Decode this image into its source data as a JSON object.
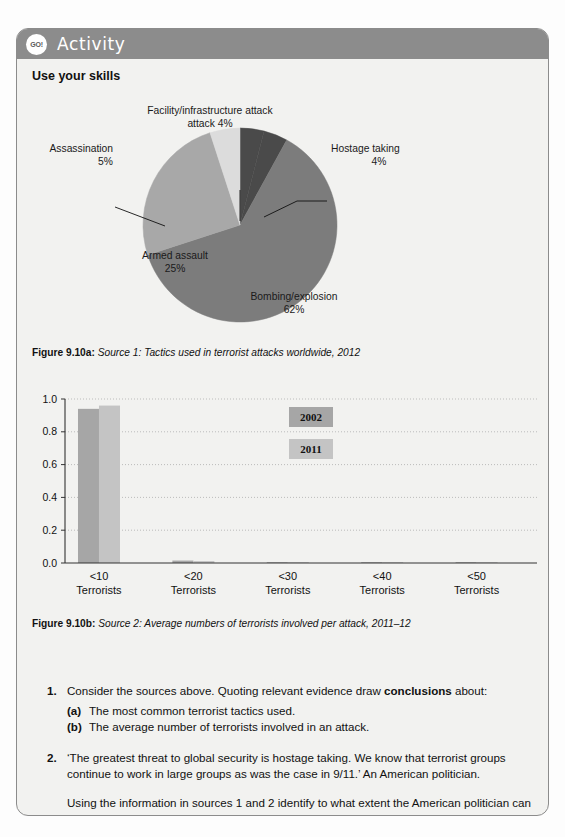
{
  "header": {
    "badge_label": "GO!",
    "title": "Activity",
    "header_color": "#8c8c8c"
  },
  "section_heading": "Use your skills",
  "figures": [
    {
      "id": "fig-9-10a",
      "label": "Figure 9.10a:",
      "caption": "Source 1: Tactics used in terrorist attacks worldwide, 2012"
    },
    {
      "id": "fig-9-10b",
      "label": "Figure 9.10b:",
      "caption": "Source 2: Average numbers of terrorists involved per attack, 2011–12"
    }
  ],
  "chart_data": [
    {
      "type": "pie",
      "title": "Tactics used in terrorist attacks worldwide, 2012",
      "labels": [
        "Bombing/explosion",
        "Armed assault",
        "Assassination",
        "Facility/infrastructure attack",
        "Hostage taking"
      ],
      "values": [
        62,
        25,
        5,
        4,
        4
      ],
      "value_labels": [
        "62%",
        "25%",
        "5%",
        "4%",
        "4%"
      ],
      "label_lines": [
        "Bombing/explosion\n62%",
        "Armed assault\n25%",
        "Assassination\n5%",
        "Facility/infrastructure\nattack 4%",
        "Hostage taking\n4%"
      ],
      "colors": [
        "#7c7c7c",
        "#a8a8a8",
        "#dcdcdc",
        "#4a4a4a",
        "#4a4a4a"
      ],
      "legend": "none",
      "units": "percent"
    },
    {
      "type": "bar",
      "title": "Average numbers of terrorists involved per attack, 2011–12",
      "categories": [
        "<10\nTerrorists",
        "<20\nTerrorists",
        "<30\nTerrorists",
        "<40\nTerrorists",
        "<50\nTerrorists"
      ],
      "category_top": [
        "<10",
        "<20",
        "<30",
        "<40",
        "<50"
      ],
      "category_bottom": [
        "Terrorists",
        "Terrorists",
        "Terrorists",
        "Terrorists",
        "Terrorists"
      ],
      "series": [
        {
          "name": "2002",
          "color": "#a6a6a6",
          "values": [
            0.94,
            0.015,
            0.005,
            0.004,
            0.003
          ]
        },
        {
          "name": "2011",
          "color": "#c4c4c4",
          "values": [
            0.96,
            0.012,
            0.005,
            0.004,
            0.003
          ]
        }
      ],
      "ytick_labels": [
        "0.0",
        "0.2",
        "0.4",
        "0.6",
        "0.8",
        "1.0"
      ],
      "yticks": [
        0.0,
        0.2,
        0.4,
        0.6,
        0.8,
        1.0
      ],
      "ylim": [
        0.0,
        1.0
      ],
      "xlabel": "",
      "ylabel": "",
      "grid": "dotted-horizontal",
      "legend_position": "center-right-inside"
    }
  ],
  "questions": [
    {
      "number": "1.",
      "text_before": "Consider the sources above. Quoting relevant evidence draw ",
      "bold": "conclusions",
      "text_after": " about:",
      "sub": [
        {
          "marker": "(a)",
          "text": "The most common terrorist tactics used."
        },
        {
          "marker": "(b)",
          "text": "The average number of terrorists involved in an attack."
        }
      ]
    },
    {
      "number": "2.",
      "text": "‘The greatest threat to global security is hostage taking. We know that terrorist groups continue to work in large groups as was the case in 9/11.’ An American politician.",
      "followup_before": "Using the information in sources 1 and 2 identify to what extent the American politician can be accused of ",
      "followup_bold": "exaggeration",
      "followup_after": "."
    }
  ]
}
